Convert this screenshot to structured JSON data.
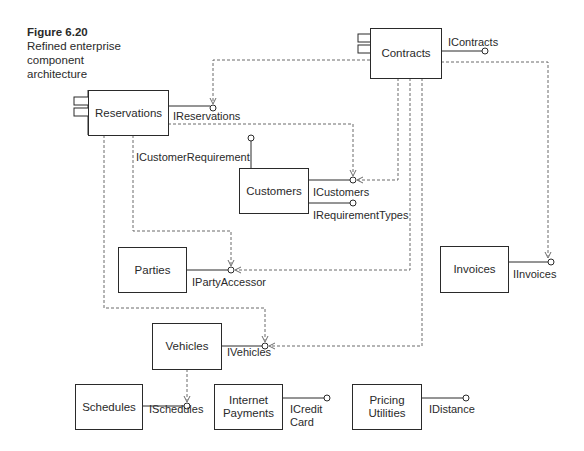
{
  "figure": {
    "number": "Figure 6.20",
    "title": "Refined enterprise component architecture"
  },
  "components": {
    "contracts": "Contracts",
    "reservations": "Reservations",
    "customers": "Customers",
    "parties": "Parties",
    "invoices": "Invoices",
    "vehicles": "Vehicles",
    "schedules": "Schedules",
    "internet_payments": "Internet Payments",
    "pricing_utilities": "Pricing Utilities"
  },
  "interfaces": {
    "icontracts": "IContracts",
    "ireservations": "IReservations",
    "icustomerrequirement": "ICustomerRequirement",
    "icustomers": "ICustomers",
    "irequirementtypes": "IRequirementTypes",
    "ipartyaccessor": "IPartyAccessor",
    "iinvoices": "IInvoices",
    "ivehicles": "IVehicles",
    "ischedules": "ISchedules",
    "icreditcard": "ICredit Card",
    "idistance": "IDistance"
  },
  "colors": {
    "line": "#2a2a2a",
    "dashed": "#6a6a6a"
  }
}
